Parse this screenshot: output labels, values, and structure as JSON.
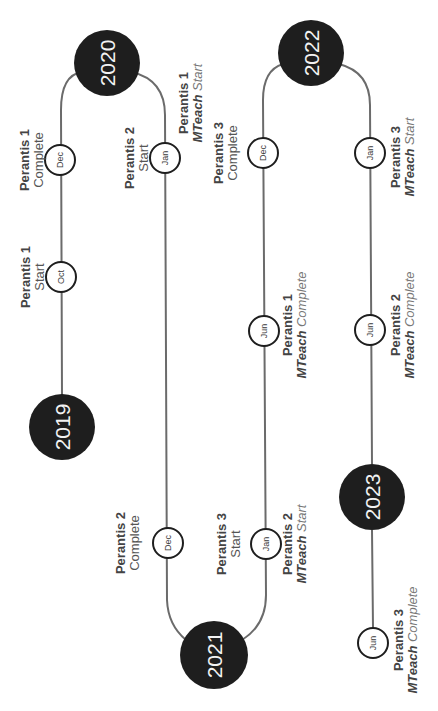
{
  "diagram": {
    "orientation": "rotated -90deg",
    "colors": {
      "year_fill": "#1e1e1e",
      "year_text": "#f2f2f2",
      "track": "#6b6b6b",
      "month_stroke": "#1e1e1e",
      "label": "#444444"
    },
    "years": [
      {
        "label": "2019"
      },
      {
        "label": "2020"
      },
      {
        "label": "2021"
      },
      {
        "label": "2022"
      },
      {
        "label": "2023"
      }
    ],
    "milestones": [
      {
        "month": "Oct",
        "year": "2019",
        "title": "Perantis 1",
        "prefix": "",
        "status": "Start"
      },
      {
        "month": "Dec",
        "year": "2019",
        "title": "Perantis 1",
        "prefix": "",
        "status": "Complete"
      },
      {
        "month": "Jan",
        "year": "2020",
        "title": "Perantis 2",
        "prefix": "",
        "status": "Start"
      },
      {
        "month": "Jan",
        "year": "2020",
        "title": "Perantis 1",
        "prefix": "MTeach",
        "status": "Start"
      },
      {
        "month": "Dec",
        "year": "2020",
        "title": "Perantis 2",
        "prefix": "",
        "status": "Complete"
      },
      {
        "month": "Jan",
        "year": "2021",
        "title": "Perantis 3",
        "prefix": "",
        "status": "Start"
      },
      {
        "month": "Jan",
        "year": "2021",
        "title": "Perantis 2",
        "prefix": "MTeach",
        "status": "Start"
      },
      {
        "month": "Jun",
        "year": "2021",
        "title": "Perantis 1",
        "prefix": "MTeach",
        "status": "Complete"
      },
      {
        "month": "Dec",
        "year": "2021",
        "title": "Perantis 3",
        "prefix": "",
        "status": "Complete"
      },
      {
        "month": "Jan",
        "year": "2022",
        "title": "Perantis 3",
        "prefix": "MTeach",
        "status": "Start"
      },
      {
        "month": "Jun",
        "year": "2022",
        "title": "Perantis 2",
        "prefix": "MTeach",
        "status": "Complete"
      },
      {
        "month": "Jun",
        "year": "2023",
        "title": "Perantis 3",
        "prefix": "MTeach",
        "status": "Complete"
      }
    ]
  }
}
